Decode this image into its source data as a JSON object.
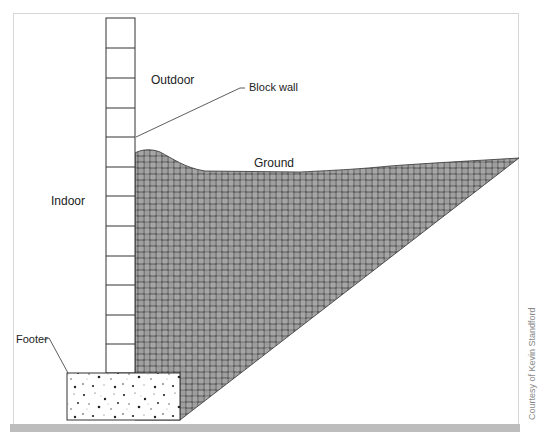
{
  "diagram": {
    "labels": {
      "outdoor": "Outdoor",
      "indoor": "Indoor",
      "block_wall": "Block wall",
      "ground": "Ground",
      "footer": "Footer"
    },
    "credit": "Courtesy of Kevin Standford",
    "colors": {
      "line": "#333333",
      "soil_dark": "#3a3a3a",
      "soil_light": "#e6e6e6",
      "frame": "#d6d6d6",
      "bottom_bar": "#bdbdbd"
    },
    "wall": {
      "blocks": 12
    }
  }
}
